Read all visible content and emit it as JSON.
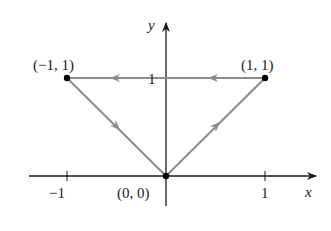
{
  "figure": {
    "type": "coordinate-path-diagram",
    "axes": {
      "x_label": "x",
      "y_label": "y",
      "x_ticks": [
        {
          "value": -1,
          "label": "−1"
        },
        {
          "value": 1,
          "label": "1"
        }
      ],
      "y_ticks": [
        {
          "value": 1,
          "label": "1"
        }
      ]
    },
    "points": [
      {
        "name": "origin",
        "label": "(0, 0)",
        "x": 0,
        "y": 0
      },
      {
        "name": "p1",
        "label": "(1, 1)",
        "x": 1,
        "y": 1
      },
      {
        "name": "p2",
        "label": "(−1, 1)",
        "x": -1,
        "y": 1
      }
    ],
    "path": [
      {
        "from": [
          0,
          0
        ],
        "to": [
          1,
          1
        ]
      },
      {
        "from": [
          1,
          1
        ],
        "to": [
          -1,
          1
        ]
      },
      {
        "from": [
          -1,
          1
        ],
        "to": [
          0,
          0
        ]
      }
    ],
    "colors": {
      "path": "#8c8c8c",
      "axes": "#1a1a1a",
      "points": "#000000"
    }
  }
}
